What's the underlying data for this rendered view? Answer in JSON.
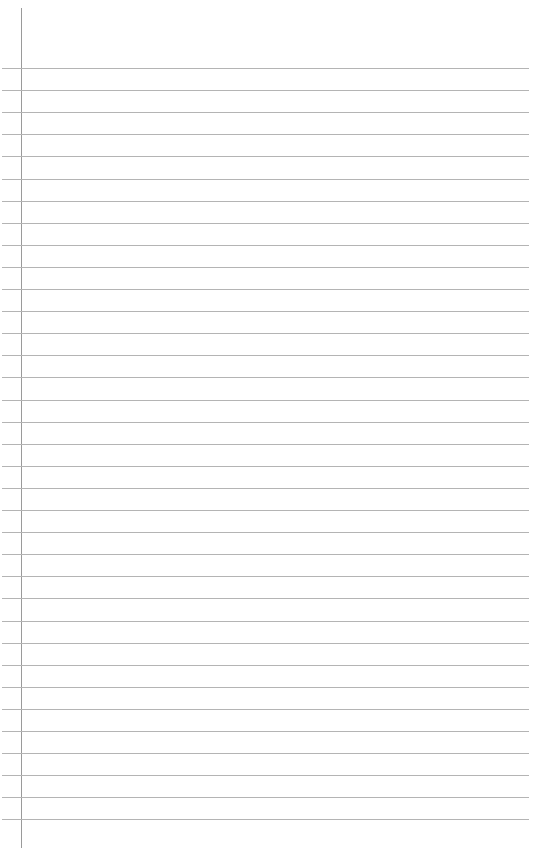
{
  "page": {
    "type": "lined-paper",
    "background_color": "#ffffff",
    "line_color": "#b4b4b4",
    "margin_line_color": "#9a9a9a",
    "rule_count": 35,
    "first_rule_y": 68,
    "rule_spacing": 22.1
  }
}
